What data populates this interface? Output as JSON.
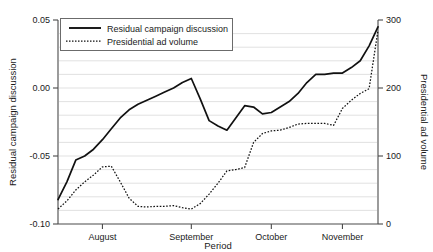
{
  "chart_data": {
    "type": "line",
    "title": "",
    "subtitle": "",
    "xlabel": "Period",
    "ylabel": "Residual campaign discussion",
    "y2label": "Presidential ad volume",
    "grid": "horizontal",
    "legend_position": "top-left-inside",
    "xlim": [
      0,
      36
    ],
    "ylim": [
      -0.1,
      0.05
    ],
    "y2lim": [
      0,
      300
    ],
    "x_tick_labels": [
      "August",
      "September",
      "October",
      "November"
    ],
    "x_tick_positions": [
      5,
      15,
      24,
      32
    ],
    "y_tick_labels": [
      "0.05",
      "0.00",
      "-0.05",
      "-0.10"
    ],
    "y_tick_values": [
      0.05,
      0.0,
      -0.05,
      -0.1
    ],
    "y2_tick_labels": [
      "300",
      "200",
      "100",
      "0"
    ],
    "y2_tick_values": [
      300,
      200,
      100,
      0
    ],
    "x": [
      0,
      1,
      2,
      3,
      4,
      5,
      6,
      7,
      8,
      9,
      10,
      11,
      12,
      13,
      14,
      15,
      16,
      17,
      18,
      19,
      20,
      21,
      22,
      23,
      24,
      25,
      26,
      27,
      28,
      29,
      30,
      31,
      32,
      33,
      34,
      35,
      36
    ],
    "series": [
      {
        "name": "Residual campaign discussion",
        "axis": "left",
        "style": "solid",
        "values": [
          -0.082,
          -0.069,
          -0.053,
          -0.05,
          -0.045,
          -0.038,
          -0.03,
          -0.022,
          -0.016,
          -0.012,
          -0.009,
          -0.006,
          -0.003,
          0.0,
          0.004,
          0.007,
          -0.008,
          -0.024,
          -0.028,
          -0.031,
          -0.022,
          -0.013,
          -0.014,
          -0.019,
          -0.018,
          -0.014,
          -0.01,
          -0.004,
          0.004,
          0.01,
          0.01,
          0.011,
          0.011,
          0.015,
          0.02,
          0.031,
          0.045
        ]
      },
      {
        "name": "Presidential ad volume",
        "axis": "right",
        "style": "dotted",
        "values": [
          22,
          34,
          50,
          62,
          72,
          84,
          85,
          62,
          38,
          26,
          25,
          26,
          26,
          27,
          24,
          22,
          30,
          44,
          60,
          78,
          80,
          83,
          120,
          133,
          137,
          138,
          142,
          147,
          148,
          148,
          148,
          145,
          170,
          182,
          192,
          199,
          285
        ]
      }
    ]
  },
  "legend": {
    "items": [
      {
        "label": "Residual campaign discussion",
        "style": "solid"
      },
      {
        "label": "Presidential ad volume",
        "style": "dotted"
      }
    ]
  },
  "axes": {
    "left_title": "Residual campaign discussion",
    "right_title": "Presidential ad volume",
    "bottom_title": "Period"
  },
  "colors": {
    "line": "#111111",
    "axis": "#4a4a4a",
    "grid": "#d9d9d9",
    "background": "#ffffff",
    "text": "#1a1a1a"
  }
}
